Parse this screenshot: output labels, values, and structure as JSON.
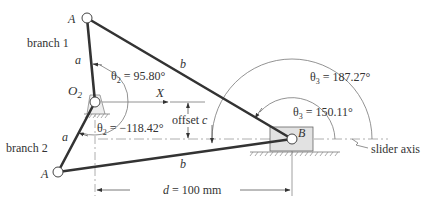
{
  "diagram": {
    "labels": {
      "branch1": "branch 1",
      "branch2": "branch 2",
      "pointA_top": "A",
      "pointA_bottom": "A",
      "pivot": "O",
      "pivot_sub": "2",
      "pointB": "B",
      "x_axis": "X",
      "link_a_top": "a",
      "link_a_bottom": "a",
      "link_b_top": "b",
      "link_b_bottom": "b",
      "offset": "offset ",
      "offset_var": "c",
      "slider_axis": "slider axis",
      "d_var": "d",
      "d_value": " = 100 mm"
    },
    "angles": {
      "theta2_branch1": {
        "symbol": "θ",
        "sub": "2",
        "value": " = 95.80°"
      },
      "theta2_branch2": {
        "symbol": "θ",
        "sub": "2",
        "value": " = −118.42°"
      },
      "theta3_branch1": {
        "symbol": "θ",
        "sub": "3",
        "value": " = 150.11°"
      },
      "theta3_branch2": {
        "symbol": "θ",
        "sub": "3",
        "value": " = 187.27°"
      }
    },
    "colors": {
      "link": "#333333",
      "slider_fill": "#e2e2e2",
      "annotation": "#777777"
    }
  }
}
